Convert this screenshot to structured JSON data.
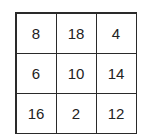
{
  "grid": {
    "rows": [
      [
        "8",
        "18",
        "4"
      ],
      [
        "6",
        "10",
        "14"
      ],
      [
        "16",
        "2",
        "12"
      ]
    ]
  }
}
